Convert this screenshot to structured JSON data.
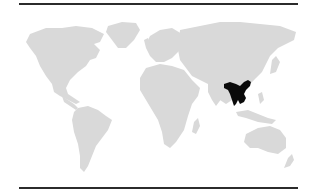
{
  "map": {
    "type": "world-range-map",
    "projection": "equirectangular-like",
    "land_color": "#d9d9d9",
    "highlight_color": "#0a0a0a",
    "rule_color": "#2b2b2b",
    "highlighted_region": {
      "description": "Southern China, northeast India, Bangladesh, Myanmar, Thailand, Laos, Vietnam",
      "bbox_px": [
        224,
        80,
        251,
        106
      ]
    },
    "continents": [
      "North America",
      "South America",
      "Europe",
      "Africa",
      "Asia",
      "Australia"
    ]
  }
}
